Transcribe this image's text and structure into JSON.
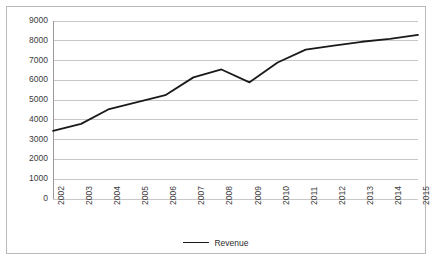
{
  "chart_data": {
    "type": "line",
    "title": "",
    "xlabel": "",
    "ylabel": "",
    "categories": [
      "2002",
      "2003",
      "2004",
      "2005",
      "2006",
      "2007",
      "2008",
      "2009",
      "2010",
      "2011",
      "2012",
      "2013",
      "2014",
      "2015"
    ],
    "series": [
      {
        "name": "Revenue",
        "color": "#1a1a1a",
        "values": [
          3450,
          3800,
          4550,
          4900,
          5250,
          6150,
          6550,
          5900,
          6900,
          7550,
          7750,
          7950,
          8100,
          8300
        ]
      }
    ],
    "ylim": [
      0,
      9000
    ],
    "yticks": [
      0,
      1000,
      2000,
      3000,
      4000,
      5000,
      6000,
      7000,
      8000,
      9000
    ],
    "ytick_labels": [
      "0",
      "1000",
      "2000",
      "3000",
      "4000",
      "5000",
      "6000",
      "7000",
      "8000",
      "9000"
    ],
    "grid": "horizontal",
    "legend_position": "bottom-center",
    "legend_entries": [
      "Revenue"
    ],
    "xtick_rotation": -90,
    "border_color": "#b9b9b9",
    "gridline_color": "#c8c8c8",
    "background": "#ffffff"
  }
}
